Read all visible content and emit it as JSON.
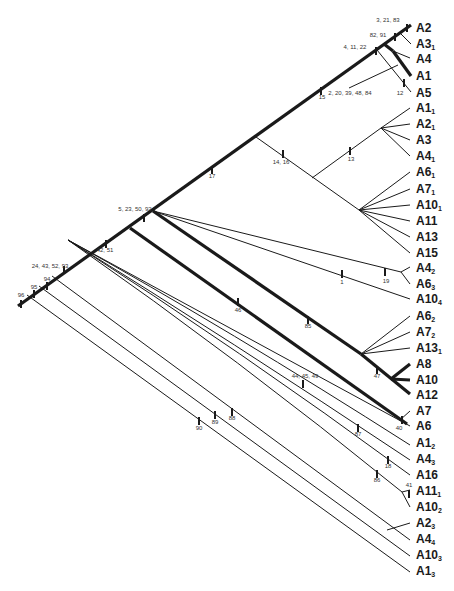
{
  "figure": {
    "type": "cladogram",
    "tips": [
      {
        "id": "A2",
        "label": "A2",
        "sub": "",
        "y": 28
      },
      {
        "id": "A3_1",
        "label": "A3",
        "sub": "1",
        "y": 44
      },
      {
        "id": "A4",
        "label": "A4",
        "sub": "",
        "y": 59
      },
      {
        "id": "A1",
        "label": "A1",
        "sub": "",
        "y": 76
      },
      {
        "id": "A5",
        "label": "A5",
        "sub": "",
        "y": 93
      },
      {
        "id": "A1_1",
        "label": "A1",
        "sub": "1",
        "y": 108
      },
      {
        "id": "A2_1",
        "label": "A2",
        "sub": "1",
        "y": 124
      },
      {
        "id": "A3",
        "label": "A3",
        "sub": "",
        "y": 140
      },
      {
        "id": "A4_1",
        "label": "A4",
        "sub": "1",
        "y": 156
      },
      {
        "id": "A6_1",
        "label": "A6",
        "sub": "1",
        "y": 172
      },
      {
        "id": "A7_1",
        "label": "A7",
        "sub": "1",
        "y": 189
      },
      {
        "id": "A10_1",
        "label": "A10",
        "sub": "1",
        "y": 205
      },
      {
        "id": "A11",
        "label": "A11",
        "sub": "",
        "y": 221
      },
      {
        "id": "A13",
        "label": "A13",
        "sub": "",
        "y": 237
      },
      {
        "id": "A15",
        "label": "A15",
        "sub": "",
        "y": 253
      },
      {
        "id": "A4_2",
        "label": "A4",
        "sub": "2",
        "y": 268
      },
      {
        "id": "A6_3",
        "label": "A6",
        "sub": "3",
        "y": 284
      },
      {
        "id": "A10_4",
        "label": "A10",
        "sub": "4",
        "y": 299
      },
      {
        "id": "A6_2",
        "label": "A6",
        "sub": "2",
        "y": 316
      },
      {
        "id": "A7_2",
        "label": "A7",
        "sub": "2",
        "y": 332
      },
      {
        "id": "A13_1",
        "label": "A13",
        "sub": "1",
        "y": 348
      },
      {
        "id": "A8",
        "label": "A8",
        "sub": "",
        "y": 364
      },
      {
        "id": "A10",
        "label": "A10",
        "sub": "",
        "y": 380
      },
      {
        "id": "A12",
        "label": "A12",
        "sub": "",
        "y": 395
      },
      {
        "id": "A7",
        "label": "A7",
        "sub": "",
        "y": 411
      },
      {
        "id": "A6",
        "label": "A6",
        "sub": "",
        "y": 426
      },
      {
        "id": "A1_2",
        "label": "A1",
        "sub": "2",
        "y": 443
      },
      {
        "id": "A4_3",
        "label": "A4",
        "sub": "3",
        "y": 459
      },
      {
        "id": "A16",
        "label": "A16",
        "sub": "",
        "y": 475
      },
      {
        "id": "A11_1",
        "label": "A11",
        "sub": "1",
        "y": 491
      },
      {
        "id": "A10_2",
        "label": "A10",
        "sub": "2",
        "y": 507
      },
      {
        "id": "A2_3",
        "label": "A2",
        "sub": "3",
        "y": 523
      },
      {
        "id": "A4_4",
        "label": "A4",
        "sub": "4",
        "y": 539
      },
      {
        "id": "A10_3",
        "label": "A10",
        "sub": "3",
        "y": 555
      },
      {
        "id": "A1_3",
        "label": "A1",
        "sub": "3",
        "y": 571
      }
    ],
    "character_labels": [
      {
        "text": "3, 21, 83",
        "x": 388,
        "y": 22
      },
      {
        "text": "82, 91",
        "x": 378,
        "y": 37
      },
      {
        "text": "4, 11, 22",
        "x": 355,
        "y": 49
      },
      {
        "text": "2, 20, 39, 48, 84",
        "x": 350,
        "y": 95
      },
      {
        "text": "12",
        "x": 400,
        "y": 95
      },
      {
        "text": "15",
        "x": 322,
        "y": 99
      },
      {
        "text": "14, 16",
        "x": 281,
        "y": 164
      },
      {
        "text": "13",
        "x": 351,
        "y": 161
      },
      {
        "text": "17",
        "x": 212,
        "y": 178
      },
      {
        "text": "5, 23, 50, 92",
        "x": 135,
        "y": 211
      },
      {
        "text": "42, 51",
        "x": 105,
        "y": 252
      },
      {
        "text": "24, 43, 52, 93",
        "x": 50,
        "y": 268
      },
      {
        "text": "94",
        "x": 47,
        "y": 281
      },
      {
        "text": "95",
        "x": 34,
        "y": 289
      },
      {
        "text": "96",
        "x": 21,
        "y": 297
      },
      {
        "text": "1",
        "x": 342,
        "y": 284
      },
      {
        "text": "19",
        "x": 386,
        "y": 283
      },
      {
        "text": "46",
        "x": 238,
        "y": 312
      },
      {
        "text": "85",
        "x": 308,
        "y": 328
      },
      {
        "text": "47",
        "x": 377,
        "y": 378
      },
      {
        "text": "40",
        "x": 399,
        "y": 430
      },
      {
        "text": "44, 45, 49",
        "x": 305,
        "y": 378
      },
      {
        "text": "87",
        "x": 358,
        "y": 436
      },
      {
        "text": "18",
        "x": 388,
        "y": 468
      },
      {
        "text": "86",
        "x": 377,
        "y": 482
      },
      {
        "text": "41",
        "x": 409,
        "y": 487
      },
      {
        "text": "88",
        "x": 232,
        "y": 420
      },
      {
        "text": "89",
        "x": 215,
        "y": 424
      },
      {
        "text": "90",
        "x": 199,
        "y": 430
      }
    ]
  }
}
